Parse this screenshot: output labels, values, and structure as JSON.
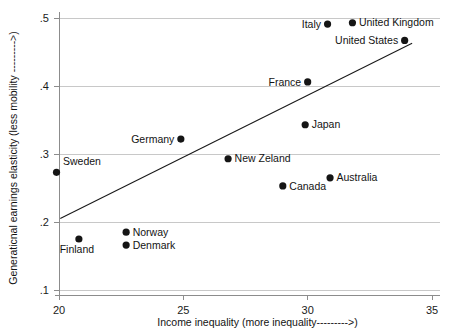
{
  "chart_data": {
    "type": "scatter",
    "title": "",
    "xlabel": "Income inequality (more inequality--------->)",
    "ylabel": "Generaticnal earnings elasticity (less mobility --------->)",
    "xlim": [
      20,
      35
    ],
    "ylim": [
      0.1,
      0.5
    ],
    "xticks": [
      20,
      25,
      30,
      35
    ],
    "xtick_labels": [
      "20",
      "25",
      "30",
      "35"
    ],
    "yticks": [
      0.1,
      0.2,
      0.3,
      0.4,
      0.5
    ],
    "ytick_labels": [
      ".1",
      ".2",
      ".3",
      ".4",
      ".5"
    ],
    "grid": "horizontal",
    "legend": "none",
    "marker_color": "#151515",
    "trendline_color": "#1a1a1a",
    "grid_color": "#c8c8c8",
    "axis_color": "#8c8c8c",
    "points": [
      {
        "name": "Sweden",
        "x": 19.9,
        "y": 0.273,
        "label_pos": "above-right"
      },
      {
        "name": "Finland",
        "x": 20.8,
        "y": 0.175,
        "label_pos": "below-right"
      },
      {
        "name": "Norway",
        "x": 22.7,
        "y": 0.185,
        "label_pos": "right"
      },
      {
        "name": "Denmark",
        "x": 22.7,
        "y": 0.166,
        "label_pos": "right"
      },
      {
        "name": "Germany",
        "x": 24.9,
        "y": 0.322,
        "label_pos": "left"
      },
      {
        "name": "New Zeland",
        "x": 26.8,
        "y": 0.293,
        "label_pos": "right"
      },
      {
        "name": "Canada",
        "x": 29.0,
        "y": 0.253,
        "label_pos": "right"
      },
      {
        "name": "Japan",
        "x": 29.9,
        "y": 0.343,
        "label_pos": "right"
      },
      {
        "name": "France",
        "x": 30.0,
        "y": 0.406,
        "label_pos": "left"
      },
      {
        "name": "Australia",
        "x": 30.9,
        "y": 0.265,
        "label_pos": "right"
      },
      {
        "name": "Italy",
        "x": 30.8,
        "y": 0.491,
        "label_pos": "left"
      },
      {
        "name": "United Kingdom",
        "x": 31.8,
        "y": 0.493,
        "label_pos": "right"
      },
      {
        "name": "United States",
        "x": 33.9,
        "y": 0.467,
        "label_pos": "left"
      }
    ],
    "trendline": {
      "x0": 20.05,
      "y0": 0.205,
      "x1": 34.2,
      "y1": 0.463
    }
  }
}
